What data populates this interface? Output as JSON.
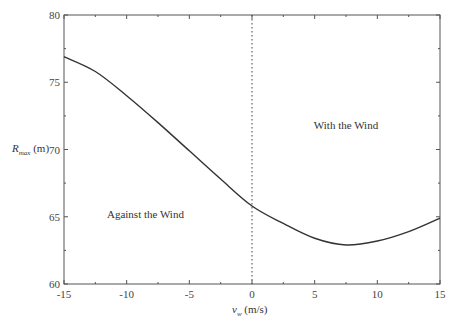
{
  "chart_data": {
    "type": "line",
    "title": "",
    "xlabel": "v_w (m/s)",
    "xlabel_main": "v",
    "xlabel_sub": "w",
    "xlabel_unit": " (m/s)",
    "ylabel": "R_max (m)",
    "ylabel_main": "R",
    "ylabel_sub": "max",
    "ylabel_unit": " (m)",
    "xlim": [
      -15,
      15
    ],
    "ylim": [
      60,
      80
    ],
    "xticks": [
      -15,
      -10,
      -5,
      0,
      5,
      10,
      15
    ],
    "yticks": [
      60,
      65,
      70,
      75,
      80
    ],
    "grid": false,
    "legend": null,
    "series": [
      {
        "name": "R_max",
        "x": [
          -15,
          -12.5,
          -10,
          -7.5,
          -5,
          -2.5,
          0,
          2.5,
          5,
          7.5,
          10,
          12.5,
          15
        ],
        "values": [
          76.9,
          75.8,
          74.0,
          72.0,
          69.9,
          67.8,
          65.8,
          64.5,
          63.4,
          62.9,
          63.2,
          63.9,
          64.9
        ]
      }
    ],
    "reference_lines": [
      {
        "orientation": "vertical",
        "x": 0,
        "style": "dotted"
      }
    ],
    "annotations": [
      {
        "text": "With the Wind",
        "x": 7.5,
        "y": 71.5
      },
      {
        "text": "Against the Wind",
        "x": -8.5,
        "y": 64.9
      }
    ]
  }
}
